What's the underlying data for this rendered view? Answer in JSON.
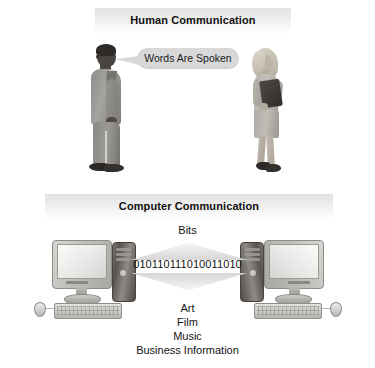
{
  "figure": {
    "background_color": "#ffffff",
    "banner_color": "#e2e2e2",
    "text_color": "#131313"
  },
  "human_section": {
    "banner_title": "Human Communication",
    "speech_bubble_text": "Words Are Spoken",
    "speaker": "man-figure",
    "listener": "woman-figure"
  },
  "computer_section": {
    "banner_title": "Computer Communication",
    "up_label": "Bits",
    "binary_stream": "010110111010011010",
    "down_labels": [
      "Art",
      "Film",
      "Music",
      "Business Information"
    ],
    "left_device": "desktop-computer-left",
    "right_device": "desktop-computer-right"
  }
}
